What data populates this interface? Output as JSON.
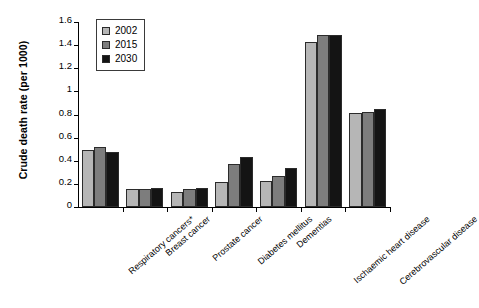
{
  "chart_data": {
    "type": "bar",
    "title": "",
    "xlabel": "",
    "ylabel": "Crude death rate (per 1000)",
    "ylim": [
      0,
      1.6
    ],
    "yticks": [
      "0",
      "0.2",
      "0.4",
      "0.6",
      "0.8",
      "1",
      "1.2",
      "1.4",
      "1.6"
    ],
    "ytick_values": [
      0,
      0.2,
      0.4,
      0.6,
      0.8,
      1,
      1.2,
      1.4,
      1.6
    ],
    "grid": false,
    "legend_position": "top-left",
    "categories": [
      "Respiratory cancers*",
      "Breast cancer",
      "Prostate cancer",
      "Diabetes mellitus",
      "Dementias",
      "Ischaemic heart disease",
      "Cerebrovascular disease"
    ],
    "series": [
      {
        "name": "2002",
        "color": "#b6b6b6",
        "values": [
          0.49,
          0.16,
          0.13,
          0.22,
          0.225,
          1.43,
          0.81
        ]
      },
      {
        "name": "2015",
        "color": "#7d7d7d",
        "values": [
          0.52,
          0.16,
          0.155,
          0.37,
          0.27,
          1.49,
          0.825
        ]
      },
      {
        "name": "2030",
        "color": "#141414",
        "values": [
          0.475,
          0.165,
          0.165,
          0.43,
          0.335,
          1.49,
          0.85
        ]
      }
    ]
  }
}
